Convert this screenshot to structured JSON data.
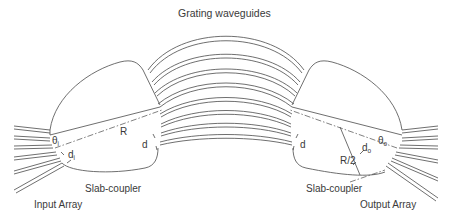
{
  "diagram": {
    "title": "Grating waveguides",
    "labels": {
      "input_array": "Input Array",
      "output_array": "Output Array",
      "slab_coupler_left": "Slab-coupler",
      "slab_coupler_right": "Slab-coupler",
      "radius_left": "R",
      "radius_right": "R/2",
      "spacing_left": "d",
      "spacing_right": "d",
      "theta_i": "θ",
      "theta_i_sub": "i",
      "theta_o": "θ",
      "theta_o_sub": "o",
      "d_i": "d",
      "d_i_sub": "i",
      "d_o": "d",
      "d_o_sub": "o"
    },
    "colors": {
      "stroke": "#4a4a4a",
      "text": "#3a3a3a",
      "background": "#ffffff"
    },
    "grating_waveguide_count": 11,
    "input_waveguide_count": 6,
    "output_waveguide_count": 6
  }
}
